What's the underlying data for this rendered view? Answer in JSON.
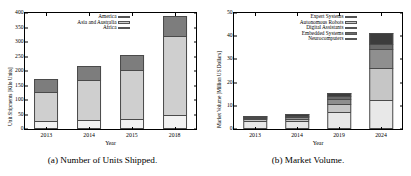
{
  "figure": {
    "panels": [
      {
        "caption": "(a)  Number of Units Shipped.",
        "xlabel": "Year",
        "ylabel": "Unit Shipments [Kilo Units]"
      },
      {
        "caption": "(b)  Market Volume.",
        "xlabel": "Year",
        "ylabel": "Market Volume [Million US Dollars]"
      }
    ]
  },
  "chart_data": [
    {
      "type": "bar",
      "title": "(a)  Number of Units Shipped.",
      "stacked": true,
      "xlabel": "Year",
      "ylabel": "Unit Shipments [Kilo Units]",
      "categories": [
        "2013",
        "2014",
        "2015",
        "2018"
      ],
      "ylim": [
        0,
        400
      ],
      "yticks": [
        0,
        50,
        100,
        150,
        200,
        250,
        300,
        350,
        400
      ],
      "grid": false,
      "legend_position": "top-right-inside",
      "series": [
        {
          "name": "America",
          "values": [
            45,
            47,
            52,
            68
          ],
          "color": "#7d7d7d"
        },
        {
          "name": "Asia and Australia",
          "values": [
            98,
            137,
            167,
            273
          ],
          "color": "#cfcfcf"
        },
        {
          "name": "Europe",
          "values": [
            0,
            0,
            0,
            0
          ],
          "color": "#b5b5b5"
        },
        {
          "name": "Africa",
          "values": [
            29,
            32,
            36,
            49
          ],
          "color": "#f2f2f2"
        }
      ],
      "stack_order_bottom_to_top": [
        "Africa",
        "Europe",
        "Asia and Australia",
        "America"
      ],
      "totals": [
        172,
        216,
        255,
        390
      ]
    },
    {
      "type": "bar",
      "title": "(b)  Market Volume.",
      "stacked": true,
      "xlabel": "Year",
      "ylabel": "Market Volume [Million US Dollars]",
      "categories": [
        "2013",
        "2014",
        "2019",
        "2024"
      ],
      "ylim": [
        0,
        50
      ],
      "yticks": [
        0,
        10,
        20,
        30,
        40,
        50
      ],
      "grid": false,
      "legend_position": "top-right-inside",
      "series": [
        {
          "name": "Expert Systems",
          "values": [
            3.4,
            3.5,
            7.2,
            12.7
          ],
          "color": "#e8e8e8"
        },
        {
          "name": "Autonomous Robots",
          "values": [
            0.8,
            0.9,
            3.6,
            13.8
          ],
          "color": "#c6c6c6"
        },
        {
          "name": "Digital Assistants",
          "values": [
            0.5,
            0.9,
            2.2,
            8.0
          ],
          "color": "#8f8f8f"
        },
        {
          "name": "Embedded Systems",
          "values": [
            0.4,
            0.5,
            1.3,
            2.0
          ],
          "color": "#6a6a6a"
        },
        {
          "name": "Neurocomputers",
          "values": [
            0.4,
            0.7,
            1.2,
            5.0
          ],
          "color": "#3c3c3c"
        }
      ],
      "stack_order_bottom_to_top": [
        "Expert Systems",
        "Autonomous Robots",
        "Digital Assistants",
        "Embedded Systems",
        "Neurocomputers"
      ],
      "totals": [
        5.5,
        6.5,
        15.5,
        41.5
      ]
    }
  ]
}
